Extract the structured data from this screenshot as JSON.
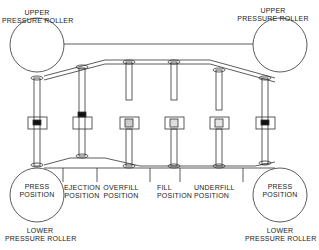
{
  "diagram": {
    "labels": {
      "upper_left": [
        "UPPER",
        "PRESSURE ROLLER"
      ],
      "upper_right": [
        "UPPER",
        "PRESSURE ROLLER"
      ],
      "press_left": [
        "PRESS",
        "POSITION"
      ],
      "lower_left": [
        "LOWER",
        "PRESSURE ROLLER"
      ],
      "ejection": [
        "EJECTION",
        "POSITION"
      ],
      "overfill": [
        "OVERFILL",
        "POSITION"
      ],
      "fill": [
        "FILL",
        "POSITION"
      ],
      "underfill": [
        "UNDERFILL",
        "POSITION"
      ],
      "press_right": [
        "PRESS",
        "POSITION"
      ],
      "lower_right": [
        "LOWER",
        "PRESSURE ROLLER"
      ]
    },
    "stations": [
      "Press",
      "Ejection",
      "Overfill",
      "Fill",
      "Underfill",
      "Press"
    ],
    "colors": {
      "line": "#333333",
      "fill_dark": "#111111",
      "hatch": "#999999",
      "background": "#ffffff"
    }
  }
}
